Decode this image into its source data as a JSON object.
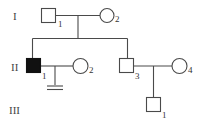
{
  "diagram": {
    "type": "pedigree",
    "generations": [
      {
        "label": "I"
      },
      {
        "label": "II"
      },
      {
        "label": "III"
      }
    ],
    "individuals": [
      {
        "id": "I-1",
        "generation": "I",
        "number": "1",
        "sex": "male",
        "affected": false
      },
      {
        "id": "I-2",
        "generation": "I",
        "number": "2",
        "sex": "female",
        "affected": false
      },
      {
        "id": "II-1",
        "generation": "II",
        "number": "1",
        "sex": "male",
        "affected": true
      },
      {
        "id": "II-2",
        "generation": "II",
        "number": "2",
        "sex": "female",
        "affected": false
      },
      {
        "id": "II-3",
        "generation": "II",
        "number": "3",
        "sex": "male",
        "affected": false
      },
      {
        "id": "II-4",
        "generation": "II",
        "number": "4",
        "sex": "female",
        "affected": false
      },
      {
        "id": "III-1",
        "generation": "III",
        "number": "1",
        "sex": "male",
        "affected": false
      }
    ],
    "unions": [
      {
        "partners": [
          "I-1",
          "I-2"
        ],
        "children": [
          "II-1",
          "II-3"
        ]
      },
      {
        "partners": [
          "II-1",
          "II-2"
        ],
        "children": [],
        "note": "no offspring (infertility marker)"
      },
      {
        "partners": [
          "II-3",
          "II-4"
        ],
        "children": [
          "III-1"
        ]
      }
    ],
    "colors": {
      "line": "#4a4a4a",
      "affected_fill": "#111111",
      "unaffected_fill": "#ffffff"
    }
  }
}
